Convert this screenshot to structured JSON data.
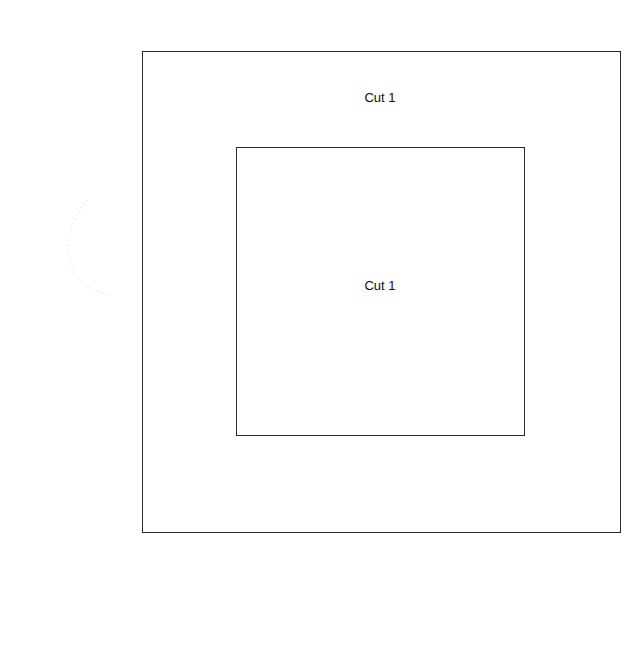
{
  "diagram": {
    "outer_square": {
      "label": "Cut 1"
    },
    "inner_square": {
      "label": "Cut 1"
    }
  },
  "colors": {
    "background": "#ffffff",
    "stroke": "#2a2a2a",
    "text": "#111111"
  }
}
